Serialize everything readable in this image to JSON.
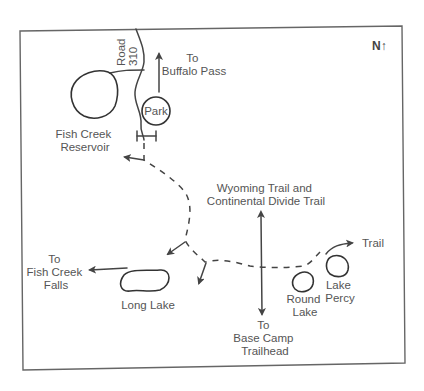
{
  "map": {
    "compass": "N↑",
    "road": {
      "line1": "Road",
      "line2": "310"
    },
    "to_buffalo_pass": {
      "line1": "To",
      "line2": "Buffalo Pass"
    },
    "park": "Park",
    "fish_creek_reservoir": {
      "line1": "Fish Creek",
      "line2": "Reservoir"
    },
    "wyoming_trail": {
      "line1": "Wyoming Trail and",
      "line2": "Continental Divide Trail"
    },
    "to_fish_creek_falls": {
      "line1": "To",
      "line2": "Fish Creek",
      "line3": "Falls"
    },
    "long_lake": "Long Lake",
    "trail": "Trail",
    "round_lake": {
      "line1": "Round",
      "line2": "Lake"
    },
    "lake_percy": {
      "line1": "Lake",
      "line2": "Percy"
    },
    "to_base_camp": {
      "line1": "To",
      "line2": "Base Camp",
      "line3": "Trailhead"
    },
    "colors": {
      "line": "#444444",
      "text": "#555555",
      "frame": "#666666",
      "background": "#ffffff"
    }
  }
}
